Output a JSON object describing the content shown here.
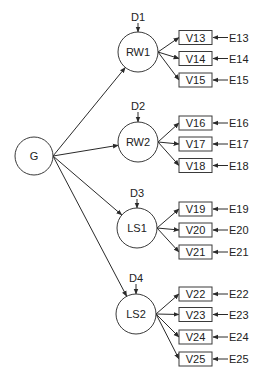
{
  "diagram": {
    "type": "structural-equation-model",
    "colors": {
      "stroke": "#3a3a3a",
      "text": "#222222",
      "background": "#ffffff"
    },
    "general_factor": {
      "id": "G",
      "label": "G",
      "cx": 34,
      "cy": 156,
      "r": 19
    },
    "factors": [
      {
        "id": "RW1",
        "label": "RW1",
        "cx": 138,
        "cy": 52,
        "r": 20,
        "disturbance": {
          "label": "D1",
          "y": 17
        },
        "indicators": [
          {
            "label": "V13",
            "error": "E13",
            "y": 37.5
          },
          {
            "label": "V14",
            "error": "E14",
            "y": 58.5
          },
          {
            "label": "V15",
            "error": "E15",
            "y": 80
          }
        ]
      },
      {
        "id": "RW2",
        "label": "RW2",
        "cx": 138,
        "cy": 142,
        "r": 20,
        "disturbance": {
          "label": "D2",
          "y": 106
        },
        "indicators": [
          {
            "label": "V16",
            "error": "E16",
            "y": 123
          },
          {
            "label": "V17",
            "error": "E17",
            "y": 144
          },
          {
            "label": "V18",
            "error": "E18",
            "y": 165.5
          }
        ]
      },
      {
        "id": "LS1",
        "label": "LS1",
        "cx": 137,
        "cy": 228,
        "r": 20,
        "disturbance": {
          "label": "D3",
          "y": 193
        },
        "indicators": [
          {
            "label": "V19",
            "error": "E19",
            "y": 209
          },
          {
            "label": "V20",
            "error": "E20",
            "y": 230
          },
          {
            "label": "V21",
            "error": "E21",
            "y": 252
          }
        ]
      },
      {
        "id": "LS2",
        "label": "LS2",
        "cx": 136,
        "cy": 314,
        "r": 20,
        "disturbance": {
          "label": "D4",
          "y": 278
        },
        "indicators": [
          {
            "label": "V22",
            "error": "E22",
            "y": 294
          },
          {
            "label": "V23",
            "error": "E23",
            "y": 314.5
          },
          {
            "label": "V24",
            "error": "E24",
            "y": 337
          },
          {
            "label": "V25",
            "error": "E25",
            "y": 359
          }
        ]
      }
    ],
    "indicator_box": {
      "x": 179,
      "width": 33,
      "height": 14
    },
    "error_label_x": 229
  }
}
